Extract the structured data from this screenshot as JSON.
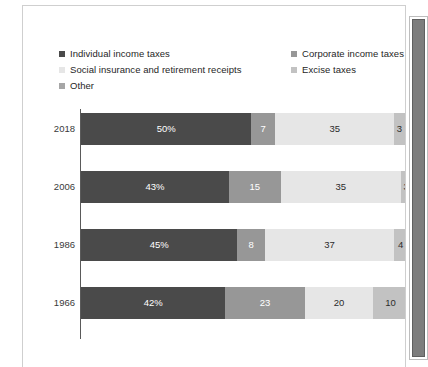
{
  "scrollbar": {
    "name": "vertical-scrollbar"
  },
  "legend": {
    "left_items": [
      {
        "label": "Individual income taxes",
        "color": "#4a4a4a"
      },
      {
        "label": "Social insurance and retirement receipts",
        "color": "#e6e6e6"
      },
      {
        "label": "Other",
        "color": "#a6a6a6"
      }
    ],
    "right_items": [
      {
        "label": "Corporate income taxes",
        "color": "#979797"
      },
      {
        "label": "Excise taxes",
        "color": "#c2c2c2"
      }
    ]
  },
  "chart_data": {
    "type": "bar",
    "orientation": "horizontal",
    "stacked": true,
    "stacked_percent": true,
    "title": "",
    "subtitle": "",
    "xlabel": "",
    "ylabel": "",
    "xlim": [
      0,
      101
    ],
    "grid": false,
    "legend_position": "top",
    "categories": [
      "2018",
      "2006",
      "1986",
      "1966"
    ],
    "series": [
      {
        "name": "Individual income taxes",
        "color": "#4a4a4a",
        "text_color": "#ffffff",
        "values": [
          50,
          43,
          45,
          42
        ],
        "labels": [
          "50%",
          "43%",
          "45%",
          "42%"
        ]
      },
      {
        "name": "Corporate income taxes",
        "color": "#979797",
        "text_color": "#ffffff",
        "values": [
          7,
          15,
          8,
          23
        ],
        "labels": [
          "7",
          "15",
          "8",
          "23"
        ]
      },
      {
        "name": "Social insurance and retirement receipts",
        "color": "#e6e6e6",
        "text_color": "#2b2b2b",
        "values": [
          35,
          35,
          37,
          20
        ],
        "labels": [
          "35",
          "35",
          "37",
          "20"
        ]
      },
      {
        "name": "Excise taxes",
        "color": "#c2c2c2",
        "text_color": "#2b2b2b",
        "values": [
          3,
          3,
          4,
          10
        ],
        "labels": [
          "3",
          "3",
          "4",
          "10"
        ]
      },
      {
        "name": "Other",
        "color": "#a6a6a6",
        "text_color": "#ffffff",
        "values": [
          6,
          4,
          5,
          5
        ],
        "labels": [
          "6",
          "4",
          "5",
          "5"
        ]
      }
    ]
  }
}
